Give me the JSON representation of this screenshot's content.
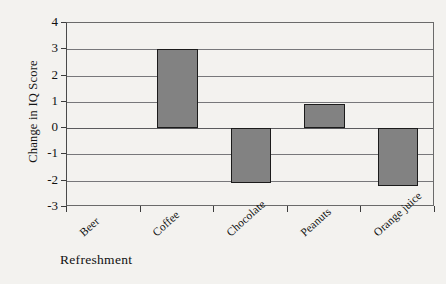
{
  "chart_data": {
    "type": "bar",
    "title": "",
    "subtitle": "",
    "xlabel": "Refreshment",
    "ylabel": "Change in IQ Score",
    "categories": [
      "Beer",
      "Coffee",
      "Chocolate",
      "Peanuts",
      "Orange juice"
    ],
    "values": [
      0,
      3.0,
      -2.1,
      0.9,
      -2.2
    ],
    "ylim": [
      -3,
      4
    ],
    "ytick_labels": [
      "4",
      "3",
      "2",
      "1",
      "0",
      "-1",
      "-2",
      "-3"
    ],
    "ytick_values": [
      4,
      3,
      2,
      1,
      0,
      -1,
      -2,
      -3
    ],
    "grid": true,
    "legend": null,
    "legend_position": "none",
    "bar_color": "#828282",
    "bar_border_color": "#1b1b1b",
    "axis_color": "#3c3c3c",
    "grid_color": "#77777a",
    "background_color": "#f3f2ef",
    "annotations": []
  }
}
